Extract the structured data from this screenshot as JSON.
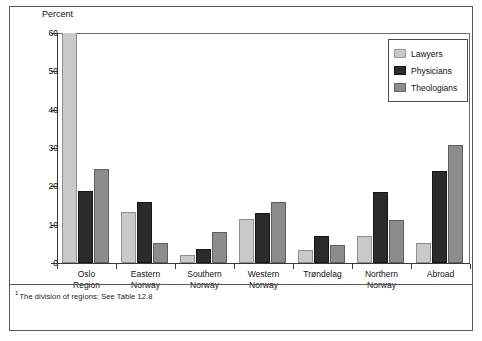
{
  "figure": {
    "footnote_mark": "1",
    "footnote_text": "The division of regions: See Table 12.8"
  },
  "colors": {
    "lawyers": "#c9c9c9",
    "physicians": "#2b2b2b",
    "theologians": "#8c8c8c",
    "axis": "#3a3a3a",
    "frame": "#5a5a5a",
    "background": "#ffffff"
  },
  "chart_data": {
    "type": "bar",
    "title": "",
    "subtitle": "",
    "xlabel": "",
    "ylabel": "Percent",
    "ylim": [
      0,
      60
    ],
    "yticks": [
      0,
      10,
      20,
      30,
      40,
      50,
      60
    ],
    "ytick_labels": [
      "0",
      "10",
      "20",
      "30",
      "40",
      "50",
      "60"
    ],
    "grid": false,
    "legend_position": "top-right",
    "note": "The Oslo Region 'Lawyers' bar exceeds the 60 percent axis maximum and is clipped at the top of the plot area.",
    "categories": [
      "Oslo Region",
      "Eastern Norway",
      "Southern Norway",
      "Western Norway",
      "Trøndelag",
      "Northern Norway",
      "Abroad"
    ],
    "category_lines": [
      [
        "Oslo",
        "Region"
      ],
      [
        "Eastern",
        "Norway"
      ],
      [
        "Southern",
        "Norway"
      ],
      [
        "Western",
        "Norway"
      ],
      [
        "Trøndelag",
        ""
      ],
      [
        "Northern",
        "Norway"
      ],
      [
        "Abroad",
        ""
      ]
    ],
    "series": [
      {
        "name": "Lawyers",
        "color": "#c9c9c9",
        "values": [
          62.0,
          13.2,
          2.2,
          11.5,
          3.3,
          7.0,
          5.3
        ],
        "clipped": [
          true,
          false,
          false,
          false,
          false,
          false,
          false
        ]
      },
      {
        "name": "Physicians",
        "color": "#2b2b2b",
        "values": [
          18.7,
          16.0,
          3.7,
          13.1,
          7.1,
          18.4,
          24.1
        ],
        "clipped": [
          false,
          false,
          false,
          false,
          false,
          false,
          false
        ]
      },
      {
        "name": "Theologians",
        "color": "#8c8c8c",
        "values": [
          24.5,
          5.1,
          8.2,
          15.9,
          4.8,
          11.3,
          30.7
        ],
        "clipped": [
          false,
          false,
          false,
          false,
          false,
          false,
          false
        ]
      }
    ]
  },
  "legend": {
    "items": [
      {
        "label": "Lawyers",
        "key": "lawyers"
      },
      {
        "label": "Physicians",
        "key": "physicians"
      },
      {
        "label": "Theologians",
        "key": "theologians"
      }
    ]
  }
}
